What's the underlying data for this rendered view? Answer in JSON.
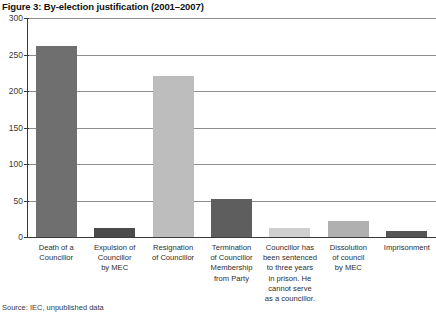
{
  "figure": {
    "title": "Figure 3: By-election justification (2001–2007)",
    "source_note": "Source: IEC, unpublished data"
  },
  "chart_data": {
    "type": "bar",
    "title": "Figure 3: By-election justification (2001–2007)",
    "xlabel": "",
    "ylabel": "",
    "ylim": [
      0,
      300
    ],
    "yticks": [
      0,
      50,
      100,
      150,
      200,
      250,
      300
    ],
    "ytick_labels": [
      "0",
      "50",
      "100",
      "150",
      "200",
      "250",
      "300"
    ],
    "grid": true,
    "legend": "none",
    "categories": [
      "Death of a Councillor",
      "Expulsion of Councillor by MEC",
      "Resignation of Councillor",
      "Termination of Councillor Membership from Party",
      "Councillor has been sentenced to three years in prison. He cannot serve as a councillor.",
      "Dissolution of council by MEC",
      "Imprisonment"
    ],
    "category_lines": [
      [
        "Death of a",
        "Councillor"
      ],
      [
        "Expulsion of",
        "Councillor",
        "by MEC"
      ],
      [
        "Resignation",
        "of Councillor"
      ],
      [
        "Termination",
        "of Councillor",
        "Membership",
        "from Party"
      ],
      [
        "Councillor has",
        "been sentenced",
        "to three years",
        "in prison. He",
        "cannot serve",
        "as a councillor."
      ],
      [
        "Dissolution",
        "of council",
        "by MEC"
      ],
      [
        "Imprisonment"
      ]
    ],
    "values": [
      261,
      13,
      220,
      52,
      12,
      22,
      8
    ],
    "bar_colors": [
      "#6f6f6f",
      "#4a4a4a",
      "#bdbdbd",
      "#5e5e5e",
      "#cfcfcf",
      "#b0b0b0",
      "#555555"
    ],
    "axis_color": "#3a3a3a",
    "gridline_color": "#8d8d8d",
    "background": "#ffffff"
  }
}
